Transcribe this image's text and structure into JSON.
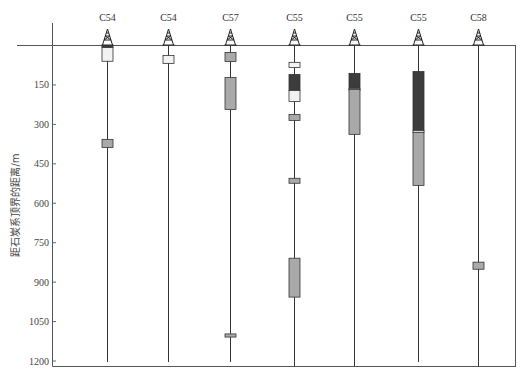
{
  "figure": {
    "y_axis_title": "距石炭系顶界的距离/m",
    "y_ticks": [
      "150",
      "300",
      "450",
      "600",
      "750",
      "900",
      "1050",
      "1200"
    ],
    "y_range": [
      0,
      1200
    ]
  },
  "colors": {
    "dark": "#3c3c3c",
    "gray": "#a9a9a9",
    "white": "#f2f2f2",
    "stroke": "#333333"
  },
  "wells": [
    {
      "name": "C54",
      "x": 107,
      "line_end": 362,
      "intervals": [
        {
          "top": 1,
          "bottom": 8,
          "fill": "dark"
        },
        {
          "top": 8,
          "bottom": 60,
          "fill": "white"
        },
        {
          "top": 357,
          "bottom": 388,
          "fill": "gray"
        }
      ]
    },
    {
      "name": "C54",
      "x": 168,
      "line_end": 362,
      "intervals": [
        {
          "top": 38,
          "bottom": 68,
          "fill": "white"
        }
      ]
    },
    {
      "name": "C57",
      "x": 230,
      "line_end": 362,
      "intervals": [
        {
          "top": 27,
          "bottom": 61,
          "fill": "gray"
        },
        {
          "top": 122,
          "bottom": 243,
          "fill": "gray"
        },
        {
          "top": 1097,
          "bottom": 1109,
          "fill": "gray"
        }
      ]
    },
    {
      "name": "C55",
      "x": 294,
      "line_end": 366,
      "intervals": [
        {
          "top": 64,
          "bottom": 84,
          "fill": "white"
        },
        {
          "top": 110,
          "bottom": 171,
          "fill": "dark"
        },
        {
          "top": 171,
          "bottom": 213,
          "fill": "white"
        },
        {
          "top": 262,
          "bottom": 285,
          "fill": "gray"
        },
        {
          "top": 505,
          "bottom": 524,
          "fill": "gray"
        },
        {
          "top": 809,
          "bottom": 957,
          "fill": "gray"
        }
      ]
    },
    {
      "name": "C55",
      "x": 354,
      "line_end": 366,
      "intervals": [
        {
          "top": 106,
          "bottom": 163,
          "fill": "dark"
        },
        {
          "top": 163,
          "bottom": 167,
          "fill": "white"
        },
        {
          "top": 167,
          "bottom": 338,
          "fill": "gray"
        }
      ]
    },
    {
      "name": "C55",
      "x": 418,
      "line_end": 362,
      "intervals": [
        {
          "top": 99,
          "bottom": 323,
          "fill": "dark"
        },
        {
          "top": 323,
          "bottom": 330,
          "fill": "white"
        },
        {
          "top": 330,
          "bottom": 532,
          "fill": "gray"
        }
      ]
    },
    {
      "name": "C58",
      "x": 478,
      "line_end": 366,
      "intervals": [
        {
          "top": 824,
          "bottom": 851,
          "fill": "gray"
        }
      ]
    }
  ]
}
